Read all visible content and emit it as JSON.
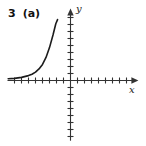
{
  "figure": {
    "problem_number": "3",
    "part_label": "(a)"
  },
  "chart_data": {
    "type": "line",
    "title": "",
    "xlabel": "x",
    "ylabel": "y",
    "x_range": [
      -9,
      9.7
    ],
    "y_range": [
      -8.6,
      10.3
    ],
    "x_ticks": [
      -8,
      -7,
      -6,
      -5,
      -4,
      -3,
      -2,
      -1,
      1,
      2,
      3,
      4,
      5,
      6,
      7,
      8
    ],
    "y_ticks": [
      -8,
      -7,
      -6,
      -5,
      -4,
      -3,
      -2,
      -1,
      1,
      2,
      3,
      4,
      5,
      6,
      7,
      8,
      9
    ],
    "grid": false,
    "legend": false,
    "axis_arrows": [
      "x-positive",
      "y-positive"
    ],
    "series": [
      {
        "name": "exponential-curve",
        "points": [
          [
            -8.9,
            0.25
          ],
          [
            -8,
            0.3
          ],
          [
            -7,
            0.45
          ],
          [
            -6,
            0.7
          ],
          [
            -5.5,
            0.9
          ],
          [
            -5,
            1.2
          ],
          [
            -4.5,
            1.65
          ],
          [
            -4,
            2.3
          ],
          [
            -3.5,
            3.3
          ],
          [
            -3,
            4.7
          ],
          [
            -2.5,
            6.5
          ],
          [
            -2.1,
            8.1
          ],
          [
            -1.85,
            8.7
          ]
        ]
      }
    ],
    "colors": {
      "axis": "#333333",
      "tick": "#333333",
      "curve": "#1c1c1c",
      "text": "#111111"
    }
  }
}
